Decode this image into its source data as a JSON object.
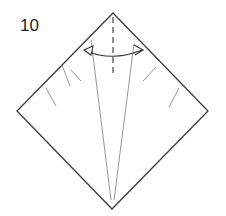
{
  "step": {
    "number": "10"
  },
  "diagram": {
    "type": "origami-fold-step",
    "colors": {
      "outline": "#3a3a3a",
      "thin_line": "#8a8a8a",
      "dashed": "#555555",
      "arrow": "#333333",
      "background": "#ffffff"
    },
    "symbols": [
      {
        "name": "valley-fold-line",
        "meaning": "dashed centre crease"
      },
      {
        "name": "fold-unfold-arrow",
        "meaning": "double-headed curved arrow: fold and unfold"
      }
    ]
  }
}
